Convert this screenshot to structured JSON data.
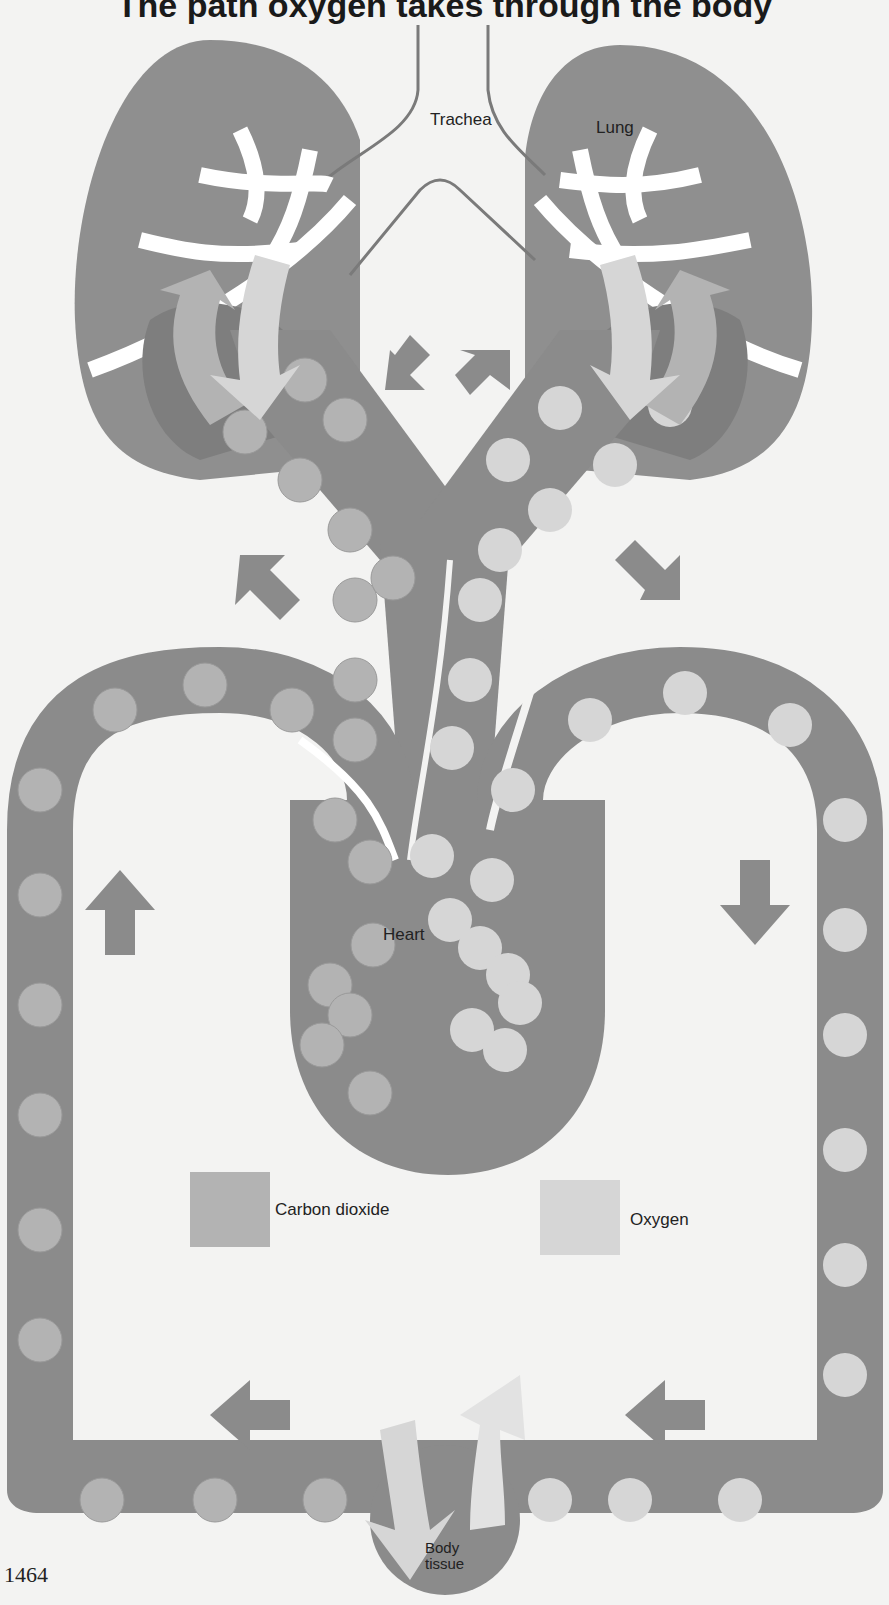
{
  "title": "The path oxygen takes through the body",
  "labels": {
    "trachea": "Trachea",
    "lung": "Lung",
    "heart": "Heart",
    "body_tissue_1": "Body",
    "body_tissue_2": "tissue"
  },
  "legend": [
    {
      "label": "Carbon dioxide",
      "color": "#b3b3b3"
    },
    {
      "label": "Oxygen",
      "color": "#d6d6d6"
    }
  ],
  "page_number": "1464",
  "colors": {
    "background": "#f3f3f2",
    "vessel": "#8b8b8b",
    "lung": "#8f8f8f",
    "carbon_dioxide": "#b3b3b3",
    "oxygen": "#d6d6d6",
    "airway": "#ffffff"
  }
}
